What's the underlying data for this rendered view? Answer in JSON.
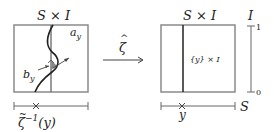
{
  "left_panel": {
    "title": "S × I",
    "label_a": "a",
    "label_a_sub": "y",
    "label_b": "b",
    "label_b_sub": "y",
    "axis_label_main": "ζ",
    "axis_label_tilde": "~",
    "axis_label_sup": "−1",
    "axis_label_arg": "(y)"
  },
  "map": {
    "label": "ζ",
    "hat": "^"
  },
  "right_panel": {
    "title": "S × I",
    "inner_label": "{y} × I",
    "axis_point_label": "y",
    "axis_S_label": "S",
    "axis_I_label": "I",
    "tick_top": "1",
    "tick_bottom": "0"
  },
  "colors": {
    "box": "#8a8a8a",
    "dark": "#222222",
    "shade": "#8a8a8a"
  }
}
